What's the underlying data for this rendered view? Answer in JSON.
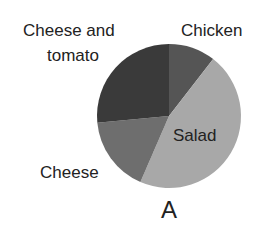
{
  "chart_data": {
    "type": "pie",
    "title": "A",
    "categories": [
      "Chicken",
      "Salad",
      "Cheese",
      "Cheese and tomato"
    ],
    "values": [
      10.5,
      46,
      17,
      26.5
    ],
    "unit": "percent (estimated from slice angles)",
    "start_angle_deg": 0,
    "direction": "clockwise",
    "colors": [
      "#555555",
      "#a8a8a8",
      "#6e6e6e",
      "#3a3a3a"
    ],
    "legend": "none (direct labels)"
  },
  "labels": {
    "cheese_and_tomato_line1": "Cheese and",
    "cheese_and_tomato_line2": "tomato",
    "chicken": "Chicken",
    "salad": "Salad",
    "cheese": "Cheese",
    "title": "A"
  }
}
